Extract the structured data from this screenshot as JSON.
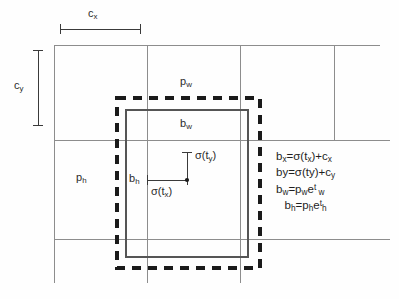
{
  "figure": {
    "kind": "bounding-box-regression-diagram",
    "background_color": "#fefefe",
    "grid_color": "#8d8d8d",
    "prior_box_color": "#1a1a1a",
    "predicted_box_color": "#555555",
    "text_color": "#2b2b2b"
  },
  "labels": {
    "cx": "c",
    "cx_sub": "x",
    "cy": "c",
    "cy_sub": "y",
    "pw": "p",
    "pw_sub": "w",
    "ph": "p",
    "ph_sub": "h",
    "bw": "b",
    "bw_sub": "w",
    "bh": "b",
    "bh_sub": "h",
    "sigma_tx": "σ(t",
    "sigma_tx_sub": "x",
    "sigma_tx_end": ")",
    "sigma_ty": "σ(t",
    "sigma_ty_sub": "y",
    "sigma_ty_end": ")"
  },
  "formulas": {
    "line1": {
      "lhs": "b",
      "lhs_sub": "x",
      "eq": "=σ(t",
      "t_sub": "x",
      "mid": ")+c",
      "c_sub": "x"
    },
    "line2": {
      "lhs": "by",
      "eq": "=σ(ty)+c",
      "c_sub": "y"
    },
    "line3": {
      "lhs": "b",
      "lhs_sub": "w",
      "eq": "=p",
      "p_sub": "w",
      "e": "e",
      "e_sup": "t",
      "e_sup_sub": " w"
    },
    "line4": {
      "lhs": "b",
      "lhs_sub": "h",
      "eq": "=p",
      "p_sub": "h",
      "e": "e",
      "e_sup": "t",
      "e_sup_sub": "h"
    }
  },
  "geometry": {
    "grid_v_lines_x": [
      54,
      147,
      240,
      334
    ],
    "grid_h_lines_y": [
      45,
      140,
      239
    ],
    "prior_box": {
      "x": 117,
      "y": 98,
      "w": 143,
      "h": 170
    },
    "pred_box": {
      "x": 126,
      "y": 110,
      "w": 122,
      "h": 147
    },
    "center_point": {
      "x": 187,
      "y": 180
    },
    "cx_bracket": {
      "x1": 60,
      "x2": 140,
      "y": 29
    },
    "cy_bracket": {
      "y1": 50,
      "y2": 125,
      "x": 38
    }
  }
}
